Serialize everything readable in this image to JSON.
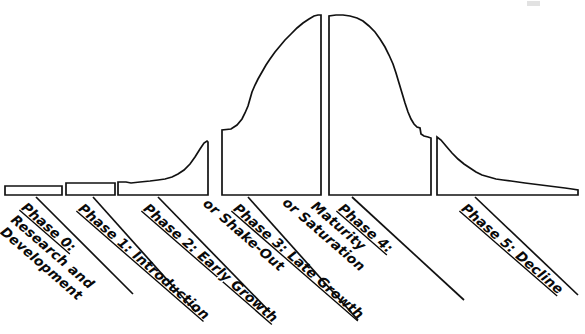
{
  "diagram": {
    "type": "industry-life-cycle-curve",
    "orientation": "horizontal",
    "background_color": "#ffffff",
    "stroke_color": "#111111",
    "text_color": "#0a0a0a",
    "baseline_y": 195,
    "peak_y": 15,
    "phases": [
      {
        "id": "phase-0",
        "index": 0,
        "heading": "Phase 0:",
        "lines": [
          "Phase 0:",
          "Research and",
          "Development"
        ],
        "label_full": "Phase 0: Research and Development",
        "shape": "flat-box",
        "x_start": 5,
        "x_end": 62,
        "top_y": 186,
        "leader_from_x": 36,
        "leader_to_x": 133,
        "leader_to_y": 294,
        "label_rotation_deg": 41
      },
      {
        "id": "phase-1",
        "index": 1,
        "heading": "Phase 1:",
        "lines": [
          "Phase 1:  Introduction"
        ],
        "label_full": "Phase 1: Introduction",
        "shape": "flat-box",
        "x_start": 66,
        "x_end": 115,
        "top_y": 183,
        "leader_from_x": 93,
        "leader_to_x": 196,
        "leader_to_y": 312,
        "label_rotation_deg": 41
      },
      {
        "id": "phase-2",
        "index": 2,
        "heading": "Phase 2:",
        "lines": [
          "Phase 2:  Early Growth"
        ],
        "label_full": "Phase 2: Early Growth",
        "shape": "rising-curve",
        "x_start": 118,
        "x_end": 208,
        "top_y": 141,
        "leader_from_x": 158,
        "leader_to_x": 270,
        "leader_to_y": 312,
        "label_rotation_deg": 41
      },
      {
        "id": "phase-3",
        "index": 3,
        "heading": "Phase 3:",
        "lines": [
          "Phase 3:  Late Growth",
          "or Shake-Out"
        ],
        "label_full": "Phase 3: Late Growth or Shake-Out",
        "shape": "steep-ascent-to-peak",
        "x_start": 222,
        "x_end": 321,
        "top_y": 15,
        "leader_from_x": 248,
        "leader_to_x": 358,
        "leader_to_y": 320,
        "label_rotation_deg": 41
      },
      {
        "id": "phase-4",
        "index": 4,
        "heading": "Phase 4:",
        "lines": [
          "Phase 4:",
          "Maturity",
          "or Saturation"
        ],
        "label_full": "Phase 4: Maturity or Saturation",
        "shape": "peak-plateau-descent",
        "x_start": 329,
        "x_end": 431,
        "top_y": 15,
        "leader_from_x": 352,
        "leader_to_x": 464,
        "leader_to_y": 300,
        "label_rotation_deg": 41
      },
      {
        "id": "phase-5",
        "index": 5,
        "heading": "Phase 5:",
        "lines": [
          "Phase 5:  Decline"
        ],
        "label_full": "Phase 5: Decline",
        "shape": "decaying-tail",
        "x_start": 437,
        "x_end": 578,
        "top_y": 137,
        "leader_from_x": 475,
        "leader_to_x": 578,
        "leader_to_y": 295,
        "label_rotation_deg": 41
      }
    ]
  }
}
